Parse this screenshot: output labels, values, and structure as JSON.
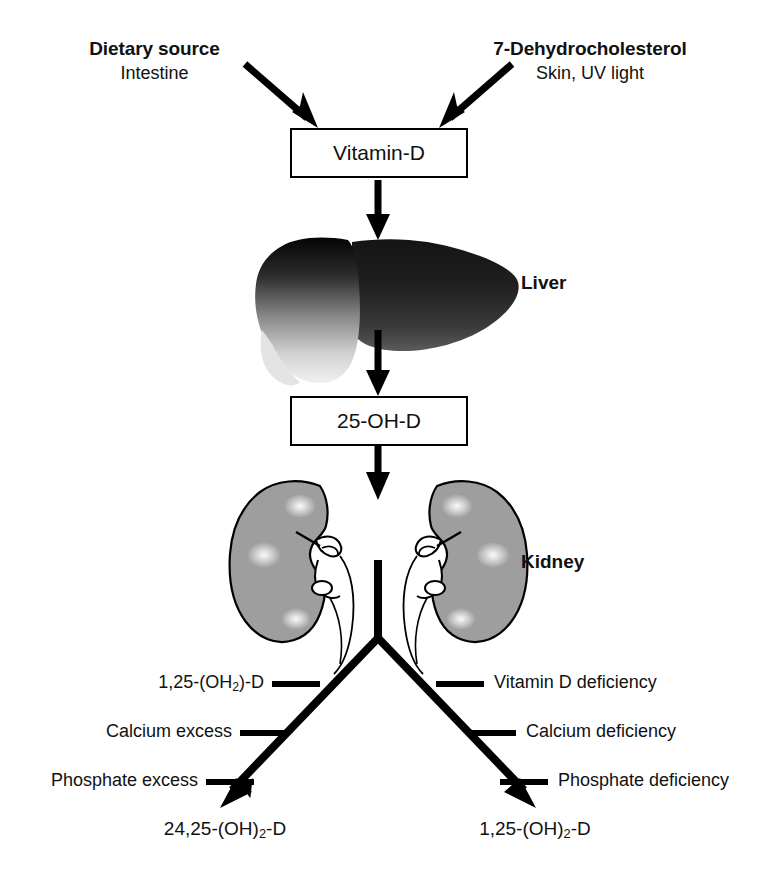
{
  "diagram": {
    "sources": [
      {
        "id": "dietary",
        "title": "Dietary source",
        "subtitle": "Intestine"
      },
      {
        "id": "skin",
        "title": "7-Dehydrocholesterol",
        "subtitle": "Skin, UV light"
      }
    ],
    "nodes": [
      {
        "id": "vitamin-d",
        "label": "Vitamin-D"
      },
      {
        "id": "25-oh-d",
        "label": "25-OH-D"
      }
    ],
    "organs": [
      {
        "id": "liver",
        "label": "Liver"
      },
      {
        "id": "kidney",
        "label": "Kidney"
      }
    ],
    "left_branch": {
      "regulators": [
        "1,25-(OH",
        "Calcium excess",
        "Phosphate excess"
      ],
      "regulator_1_prefix": "1,25-(OH",
      "regulator_1_sub": "2",
      "regulator_1_suffix": ")-D",
      "terminal_prefix": "24,25-(OH)",
      "terminal_sub": "2",
      "terminal_suffix": "-D"
    },
    "right_branch": {
      "regulators": [
        "Vitamin D deficiency",
        "Calcium deficiency",
        "Phosphate deficiency"
      ],
      "terminal_prefix": "1,25-(OH)",
      "terminal_sub": "2",
      "terminal_suffix": "-D"
    },
    "colors": {
      "stroke": "#000000",
      "background": "#ffffff",
      "liver_dark": "#0a0a0a",
      "liver_light": "#e8e8e8",
      "kidney_fill": "#9e9e9e",
      "kidney_highlight": "#f2f2f2",
      "text": "#111111"
    }
  }
}
